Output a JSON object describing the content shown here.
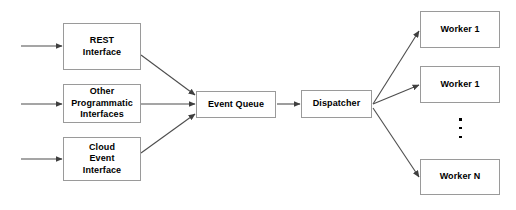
{
  "diagram": {
    "background_color": "#ffffff",
    "box_border_color": "#9a9a9a",
    "edge_color": "#4d4d4d",
    "text_color": "#000000",
    "nodes": [
      {
        "id": "rest-interface",
        "label": "REST\nInterface",
        "x": 63,
        "y": 23,
        "width": 78,
        "height": 47
      },
      {
        "id": "other-programmatic-interfaces",
        "label": "Other\nProgrammatic\nInterfaces",
        "x": 63,
        "y": 84,
        "width": 78,
        "height": 39
      },
      {
        "id": "cloud-event-interface",
        "label": "Cloud\nEvent\nInterface",
        "x": 63,
        "y": 137,
        "width": 78,
        "height": 44
      },
      {
        "id": "event-queue",
        "label": "Event Queue",
        "x": 196,
        "y": 91,
        "width": 80,
        "height": 27
      },
      {
        "id": "dispatcher",
        "label": "Dispatcher",
        "x": 301,
        "y": 90,
        "width": 71,
        "height": 28
      },
      {
        "id": "worker-1",
        "label": "Worker 1",
        "x": 420,
        "y": 11,
        "width": 80,
        "height": 37
      },
      {
        "id": "worker-2",
        "label": "Worker 1",
        "x": 420,
        "y": 66,
        "width": 80,
        "height": 37
      },
      {
        "id": "worker-n",
        "label": "Worker N",
        "x": 420,
        "y": 159,
        "width": 80,
        "height": 36
      }
    ],
    "ellipsis": {
      "label": "vertical-ellipsis",
      "dots": 3,
      "x": 459,
      "y": 118
    },
    "edges": [
      {
        "id": "input-to-rest",
        "from": "external",
        "to": "rest-interface"
      },
      {
        "id": "input-to-other",
        "from": "external",
        "to": "other-programmatic-interfaces"
      },
      {
        "id": "input-to-cloud",
        "from": "external",
        "to": "cloud-event-interface"
      },
      {
        "id": "rest-to-queue",
        "from": "rest-interface",
        "to": "event-queue"
      },
      {
        "id": "other-to-queue",
        "from": "other-programmatic-interfaces",
        "to": "event-queue"
      },
      {
        "id": "cloud-to-queue",
        "from": "cloud-event-interface",
        "to": "event-queue"
      },
      {
        "id": "queue-to-dispatcher",
        "from": "event-queue",
        "to": "dispatcher"
      },
      {
        "id": "dispatcher-to-worker-1",
        "from": "dispatcher",
        "to": "worker-1"
      },
      {
        "id": "dispatcher-to-worker-2",
        "from": "dispatcher",
        "to": "worker-2"
      },
      {
        "id": "dispatcher-to-worker-n",
        "from": "dispatcher",
        "to": "worker-n"
      }
    ]
  }
}
